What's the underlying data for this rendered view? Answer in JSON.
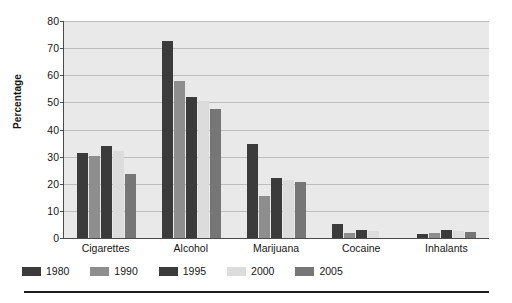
{
  "chart_data": {
    "type": "bar",
    "title": "",
    "xlabel": "",
    "ylabel": "Percentage",
    "ylim": [
      0,
      80
    ],
    "ytick_step": 10,
    "yticks": [
      0,
      10,
      20,
      30,
      40,
      50,
      60,
      70,
      80
    ],
    "grid": true,
    "legend_position": "bottom-left",
    "categories": [
      "Cigarettes",
      "Alcohol",
      "Marijuana",
      "Cocaine",
      "Inhalants"
    ],
    "series": [
      {
        "name": "1980",
        "color": "#3b3b3b",
        "values": [
          31.5,
          72.8,
          34.5,
          5.2,
          1.5
        ]
      },
      {
        "name": "1990",
        "color": "#8e8e8e",
        "values": [
          30.3,
          58.0,
          15.5,
          1.9,
          2.0
        ]
      },
      {
        "name": "1995",
        "color": "#3b3b3b",
        "values": [
          34.0,
          52.0,
          22.0,
          2.8,
          2.8
        ]
      },
      {
        "name": "2000",
        "color": "#dcdcdc",
        "values": [
          32.0,
          50.5,
          21.5,
          2.5,
          2.6
        ]
      },
      {
        "name": "2005",
        "color": "#767676",
        "values": [
          23.5,
          47.5,
          20.8,
          0.0,
          2.2
        ]
      }
    ]
  },
  "style": {
    "plot_background": "#e9e9e9",
    "gridline_color": "#bdbdbd",
    "axis_color": "#4b4b4b",
    "text_color": "#161616",
    "rule_color": "#1d1d1d"
  }
}
